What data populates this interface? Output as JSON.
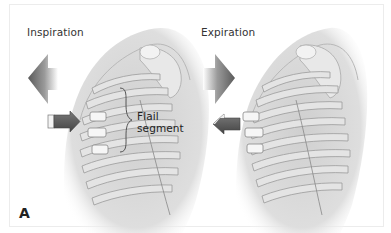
{
  "figure": {
    "panel_label": "A",
    "left_panel": {
      "title": "Inspiration",
      "big_arrow_direction": "left",
      "small_arrow_direction": "right"
    },
    "right_panel": {
      "title": "Expiration",
      "big_arrow_direction": "right",
      "small_arrow_direction": "left"
    },
    "annotation": {
      "line1": "Flail",
      "line2": "segment"
    },
    "colors": {
      "background": "#ffffff",
      "border": "#ececec",
      "arrow_dark": "#5a5a5a",
      "arrow_light": "#d8d8d8",
      "rib": "#c8c8c8",
      "rib_light": "#eaeaea",
      "body": "#dcdcdc",
      "text": "#333333"
    }
  }
}
